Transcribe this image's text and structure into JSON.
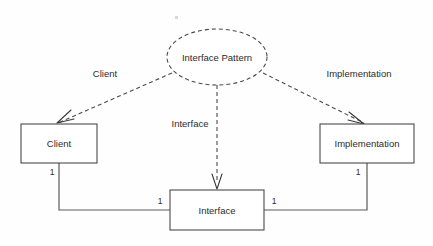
{
  "diagram": {
    "title": "Interface Pattern",
    "type": "uml-pattern-collaboration",
    "background_color": "#fefefe",
    "line_color": "#4a4a4a",
    "text_color": "#2b2b2b",
    "pattern": {
      "name": "Interface Pattern",
      "shape": "dashed-ellipse",
      "center_x": 217,
      "center_y": 57,
      "rx": 50,
      "ry": 28
    },
    "classes": [
      {
        "id": "client",
        "label": "Client",
        "x": 21,
        "y": 124,
        "width": 76,
        "height": 39
      },
      {
        "id": "implementation",
        "label": "Implementation",
        "x": 320,
        "y": 124,
        "width": 94,
        "height": 39
      },
      {
        "id": "interface",
        "label": "Interface",
        "x": 170,
        "y": 190,
        "width": 94,
        "height": 40
      }
    ],
    "role_edges": [
      {
        "id": "role-client",
        "label": "Client",
        "from": "pattern",
        "to": "client",
        "style": "dashed",
        "label_x": 105,
        "label_y": 74
      },
      {
        "id": "role-interface",
        "label": "Interface",
        "from": "pattern",
        "to": "interface",
        "style": "dashed",
        "label_x": 190,
        "label_y": 124
      },
      {
        "id": "role-implementation",
        "label": "Implementation",
        "from": "pattern",
        "to": "implementation",
        "style": "dashed",
        "label_x": 359,
        "label_y": 74
      }
    ],
    "associations": [
      {
        "id": "assoc-client-interface",
        "from": "client",
        "to": "interface",
        "style": "solid",
        "source_multiplicity": "1",
        "target_multiplicity": "1",
        "source_mult_x": 52,
        "source_mult_y": 173,
        "target_mult_x": 160,
        "target_mult_y": 202
      },
      {
        "id": "assoc-implementation-interface",
        "from": "implementation",
        "to": "interface",
        "style": "solid",
        "source_multiplicity": "1",
        "target_multiplicity": "1",
        "source_mult_x": 358,
        "source_mult_y": 173,
        "target_mult_x": 274,
        "target_mult_y": 202
      }
    ]
  }
}
